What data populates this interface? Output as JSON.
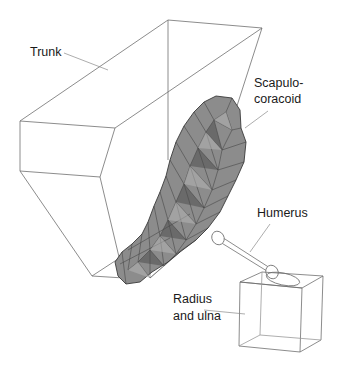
{
  "figure": {
    "type": "3D anatomical wireframe model",
    "labels": {
      "trunk": "Trunk",
      "scapulo_line1": "Scapulo-",
      "scapulo_line2": "coracoid",
      "humerus": "Humerus",
      "radius_line1": "Radius",
      "radius_line2": "and ulna"
    },
    "colors": {
      "wireframe": "#6e6e6e",
      "mesh_fill": "#8c8c8c",
      "mesh_dark": "#3a3a3a",
      "mesh_light": "#b4b4b4",
      "leader_line": "#8a8a8a",
      "background": "#ffffff"
    }
  }
}
